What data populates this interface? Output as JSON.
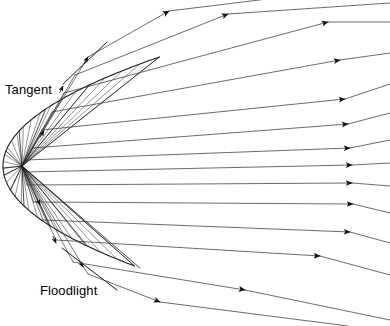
{
  "figure": {
    "labels": {
      "tangent": "Tangent",
      "floodlight": "Floodlight"
    },
    "colors": {
      "stroke": "#1a1a1a",
      "ray_stroke": "#3a3a3a",
      "background": "#ffffff",
      "text": "#000000"
    },
    "geometry": {
      "type": "parabola",
      "opens": "right",
      "vertex": [
        3,
        166
      ],
      "focus": [
        22,
        166
      ],
      "focal_length": 19,
      "aperture_top": [
        88,
        57
      ],
      "aperture_bottom": [
        88,
        266
      ],
      "curve_extent_y": [
        57,
        266
      ],
      "description": "Light source at the focus; incident rays strike the reflector and leave as a parallel beam toward the right."
    },
    "reflector_points": [
      [
        88.0,
        57.0
      ],
      [
        69.9,
        85.0
      ],
      [
        55.5,
        109.0
      ],
      [
        43.5,
        131.0
      ],
      [
        33.5,
        151.0
      ],
      [
        26.2,
        168.0
      ],
      [
        24.0,
        175.0
      ],
      [
        26.8,
        190.0
      ],
      [
        33.5,
        206.0
      ],
      [
        44.0,
        226.0
      ],
      [
        57.0,
        246.0
      ],
      [
        73.0,
        268.0
      ],
      [
        88.0,
        266.0
      ]
    ],
    "rays": [
      {
        "id": "ray-1",
        "reflect_at": [
          88.0,
          57.0
        ],
        "exit_at": [
          390.0,
          -16.0
        ]
      },
      {
        "id": "ray-2",
        "reflect_at": [
          75.0,
          75.0
        ],
        "exit_at": [
          390.0,
          3.0
        ]
      },
      {
        "id": "ray-3",
        "reflect_at": [
          64.0,
          93.0
        ],
        "exit_at": [
          390.0,
          22.0
        ]
      },
      {
        "id": "ray-4",
        "reflect_at": [
          52.0,
          112.0
        ],
        "exit_at": [
          390.0,
          53.0
        ]
      },
      {
        "id": "ray-5",
        "reflect_at": [
          42.0,
          130.0
        ],
        "exit_at": [
          390.0,
          84.0
        ]
      },
      {
        "id": "ray-6",
        "reflect_at": [
          33.0,
          148.0
        ],
        "exit_at": [
          390.0,
          113.0
        ]
      },
      {
        "id": "ray-7",
        "reflect_at": [
          26.0,
          160.0
        ],
        "exit_at": [
          390.0,
          140.0
        ]
      },
      {
        "id": "ray-8",
        "reflect_at": [
          24.0,
          172.0
        ],
        "exit_at": [
          390.0,
          163.0
        ]
      },
      {
        "id": "ray-9",
        "reflect_at": [
          27.0,
          185.0
        ],
        "exit_at": [
          390.0,
          186.0
        ]
      },
      {
        "id": "ray-10",
        "reflect_at": [
          33.5,
          202.0
        ],
        "exit_at": [
          390.0,
          213.0
        ]
      },
      {
        "id": "ray-11",
        "reflect_at": [
          43.0,
          220.0
        ],
        "exit_at": [
          390.0,
          243.0
        ]
      },
      {
        "id": "ray-12",
        "reflect_at": [
          56.0,
          240.0
        ],
        "exit_at": [
          390.0,
          275.0
        ]
      },
      {
        "id": "ray-13",
        "reflect_at": [
          73.0,
          262.0
        ],
        "exit_at": [
          390.0,
          320.0
        ]
      },
      {
        "id": "ray-14",
        "reflect_at": [
          88.0,
          274.0
        ],
        "exit_at": [
          348.0,
          326.0
        ]
      }
    ],
    "tangents": [
      {
        "id": "tangent-upper",
        "from": [
          63.0,
          84.0
        ],
        "to": [
          107.0,
          42.0
        ]
      },
      {
        "id": "tangent-lower",
        "from": [
          62.0,
          248.0
        ],
        "to": [
          117.0,
          290.0
        ]
      }
    ],
    "arrowheads": [
      {
        "ray": "ray-1",
        "at": [
          169.0,
          11.0
        ]
      },
      {
        "ray": "ray-2",
        "at": [
          228.0,
          14.0
        ]
      },
      {
        "ray": "ray-3",
        "at": [
          328.0,
          22.0
        ]
      },
      {
        "ray": "ray-4",
        "at": [
          340.0,
          60.0
        ]
      },
      {
        "ray": "ray-5",
        "at": [
          345.0,
          99.0
        ]
      },
      {
        "ray": "ray-6",
        "at": [
          348.0,
          124.0
        ]
      },
      {
        "ray": "ray-7",
        "at": [
          350.0,
          148.0
        ]
      },
      {
        "ray": "ray-8",
        "at": [
          352.0,
          165.0
        ]
      },
      {
        "ray": "ray-9",
        "at": [
          352.0,
          183.0
        ]
      },
      {
        "ray": "ray-10",
        "at": [
          353.0,
          204.0
        ]
      },
      {
        "ray": "ray-11",
        "at": [
          350.0,
          232.0
        ]
      },
      {
        "ray": "ray-12",
        "at": [
          320.0,
          256.0
        ]
      },
      {
        "ray": "ray-13",
        "at": [
          245.0,
          290.0
        ]
      },
      {
        "ray": "ray-14",
        "at": [
          160.0,
          302.0
        ]
      },
      {
        "ray": "incident-upper-1",
        "at": [
          86.0,
          59.0
        ]
      },
      {
        "ray": "incident-upper-2",
        "at": [
          63.0,
          86.0
        ]
      },
      {
        "ray": "incident-upper-3",
        "at": [
          44.0,
          131.0
        ]
      },
      {
        "ray": "incident-lower-1",
        "at": [
          40.0,
          205.0
        ]
      },
      {
        "ray": "incident-lower-2",
        "at": [
          56.0,
          243.0
        ]
      },
      {
        "ray": "incident-lower-3",
        "at": [
          83.0,
          267.0
        ]
      }
    ]
  }
}
